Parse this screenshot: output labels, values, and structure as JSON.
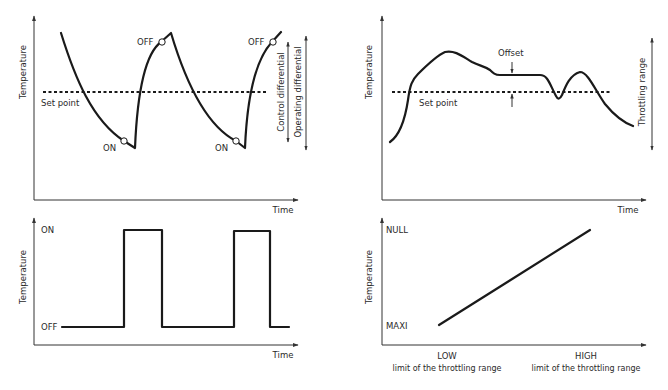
{
  "panels": {
    "on_off_control": {
      "y_label": "Temperature",
      "x_label": "Time",
      "setpoint_label": "Set point",
      "on_label_1": "ON",
      "on_label_2": "ON",
      "off_label_1": "OFF",
      "off_label_2": "OFF",
      "control_differential_label": "Control differential",
      "operating_differential_label": "Operating differential"
    },
    "on_off_output": {
      "y_label": "Temperature",
      "x_label": "Time",
      "on_label": "ON",
      "off_label": "OFF"
    },
    "proportional_control": {
      "y_label": "Temperature",
      "x_label": "Time",
      "setpoint_label": "Set point",
      "offset_label": "Offset",
      "throttling_range_label": "Throttling range"
    },
    "proportional_output": {
      "y_label": "Temperature",
      "null_label": "NULL",
      "maxi_label": "MAXI",
      "low_label": "LOW",
      "low_sublabel": "limit of the throttling range",
      "high_label": "HIGH",
      "high_sublabel": "limit of the throttling range"
    }
  },
  "colors": {
    "line": "#1a1a1a",
    "axis": "#333333",
    "background": "#ffffff"
  }
}
